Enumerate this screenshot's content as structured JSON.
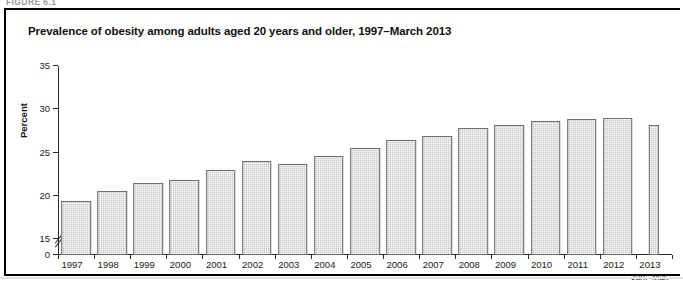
{
  "figure": {
    "caption_strip": "FIGURE 6.1",
    "title": "Prevalence of obesity among adults aged 20 years and older, 1997–March 2013"
  },
  "chart_data": {
    "type": "bar",
    "title": "Prevalence of obesity among adults aged 20 years and older, 1997–March 2013",
    "xlabel": "",
    "ylabel": "Percent",
    "ylim": [
      15,
      35
    ],
    "y_axis_break": true,
    "y_zero_label": "0",
    "yticks": [
      15,
      20,
      25,
      30,
      35
    ],
    "ytick_labels": [
      "15",
      "20",
      "25",
      "30",
      "35"
    ],
    "grid": false,
    "legend": "none",
    "categories": [
      "1997",
      "1998",
      "1999",
      "2000",
      "2001",
      "2002",
      "2003",
      "2004",
      "2005",
      "2006",
      "2007",
      "2008",
      "2009",
      "2010",
      "2011",
      "2012",
      "2013"
    ],
    "category_sublabels": [
      "",
      "",
      "",
      "",
      "",
      "",
      "",
      "",
      "",
      "",
      "",
      "",
      "",
      "",
      "",
      "",
      "Jan.–Mar."
    ],
    "values": [
      19.4,
      20.5,
      21.5,
      21.8,
      23.0,
      24.0,
      23.7,
      24.6,
      25.5,
      26.5,
      26.9,
      27.8,
      28.2,
      28.6,
      28.9,
      29.0,
      28.2
    ],
    "bar_widths_relative": [
      1,
      1,
      1,
      1,
      1,
      1,
      1,
      1,
      1,
      1,
      1,
      1,
      1,
      1,
      1,
      1,
      0.35
    ],
    "colors": {
      "bar_fill": "#c9c9c9",
      "bar_border": "#6e6e6e",
      "axis": "#2b2b2b",
      "text": "#1a1a1a",
      "frame": "#000000"
    }
  }
}
